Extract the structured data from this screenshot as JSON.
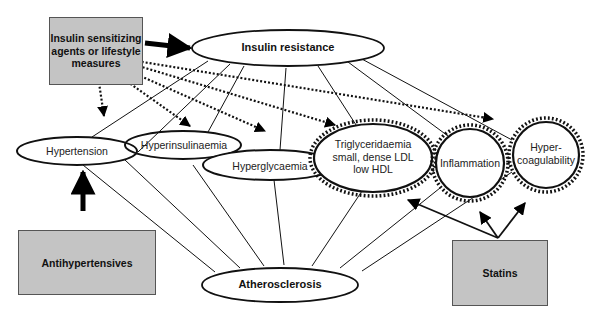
{
  "diagram": {
    "type": "concept-map",
    "nodes": {
      "insulin_sensitizing": {
        "label": "Insulin sensitizing agents or lifestyle measures",
        "shape": "gray-box"
      },
      "insulin_resistance": {
        "label": "Insulin resistance",
        "shape": "ellipse"
      },
      "hypertension": {
        "label": "Hypertension",
        "shape": "ellipse"
      },
      "hyperinsulinaemia": {
        "label": "Hyperinsulinaemia",
        "shape": "ellipse"
      },
      "hyperglycaemia": {
        "label": "Hyperglycaemia",
        "shape": "ellipse"
      },
      "dyslipidaemia": {
        "label_lines": [
          "Triglyceridaemia",
          "small, dense LDL",
          "low HDL"
        ],
        "shape": "ellipse-toothed"
      },
      "inflammation": {
        "label": "Inflammation",
        "shape": "circle-toothed"
      },
      "hypercoagulability": {
        "label_lines": [
          "Hyper-",
          "coagulability"
        ],
        "shape": "circle-toothed"
      },
      "atherosclerosis": {
        "label": "Atherosclerosis",
        "shape": "ellipse"
      },
      "antihypertensives": {
        "label": "Antihypertensives",
        "shape": "gray-box"
      },
      "statins": {
        "label": "Statins",
        "shape": "gray-box"
      }
    },
    "edges": [
      {
        "from": "insulin_sensitizing",
        "to": "insulin_resistance",
        "style": "bold-arrow"
      },
      {
        "from": "insulin_sensitizing",
        "to": "hypertension",
        "style": "dotted-arrow"
      },
      {
        "from": "insulin_sensitizing",
        "to": "hyperinsulinaemia",
        "style": "dotted-arrow"
      },
      {
        "from": "insulin_sensitizing",
        "to": "hyperglycaemia",
        "style": "dotted-arrow"
      },
      {
        "from": "insulin_sensitizing",
        "to": "dyslipidaemia",
        "style": "dotted-arrow"
      },
      {
        "from": "insulin_sensitizing",
        "to": "hypercoagulability",
        "style": "dotted-arrow"
      },
      {
        "from": "antihypertensives",
        "to": "hypertension",
        "style": "bold-arrow"
      },
      {
        "from": "statins",
        "to": "dyslipidaemia",
        "style": "arrow"
      },
      {
        "from": "statins",
        "to": "inflammation",
        "style": "arrow"
      },
      {
        "from": "statins",
        "to": "hypercoagulability",
        "style": "arrow"
      },
      {
        "from": "insulin_resistance",
        "to": "hypertension",
        "style": "line"
      },
      {
        "from": "insulin_resistance",
        "to": "hyperinsulinaemia",
        "style": "line"
      },
      {
        "from": "insulin_resistance",
        "to": "hyperglycaemia",
        "style": "line"
      },
      {
        "from": "insulin_resistance",
        "to": "dyslipidaemia",
        "style": "line"
      },
      {
        "from": "insulin_resistance",
        "to": "inflammation",
        "style": "line"
      },
      {
        "from": "insulin_resistance",
        "to": "hypercoagulability",
        "style": "line"
      },
      {
        "from": "atherosclerosis",
        "to": "hypertension",
        "style": "line"
      },
      {
        "from": "atherosclerosis",
        "to": "hyperinsulinaemia",
        "style": "line"
      },
      {
        "from": "atherosclerosis",
        "to": "hyperglycaemia",
        "style": "line"
      },
      {
        "from": "atherosclerosis",
        "to": "dyslipidaemia",
        "style": "line"
      },
      {
        "from": "atherosclerosis",
        "to": "inflammation",
        "style": "line"
      },
      {
        "from": "atherosclerosis",
        "to": "hypercoagulability",
        "style": "line"
      }
    ]
  }
}
